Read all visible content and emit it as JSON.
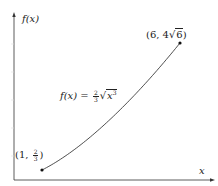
{
  "chart_data": {
    "type": "line",
    "title": "",
    "xlabel": "x",
    "ylabel": "f(x)",
    "function": "f(x) = (2/3) * sqrt(x^3)",
    "function_label": "f(x) = 2/3 √x³",
    "domain": [
      1,
      6
    ],
    "x": [
      1,
      1.5,
      2,
      2.5,
      3,
      3.5,
      4,
      4.5,
      5,
      5.5,
      6
    ],
    "series": [
      {
        "name": "f(x) = 2/3 √x³",
        "values": [
          0.667,
          1.225,
          1.886,
          2.635,
          3.464,
          4.365,
          5.333,
          6.364,
          7.454,
          8.6,
          9.798
        ]
      }
    ],
    "points": [
      {
        "label": "(1, 2/3)",
        "x": 1,
        "y": 0.667
      },
      {
        "label": "(6, 4√6)",
        "x": 6,
        "y": 9.798
      }
    ],
    "grid": false,
    "ticks_labeled": false,
    "legend": null,
    "colors": {
      "curve": "#222222",
      "axis": "#333333",
      "point": "#111111"
    }
  },
  "labels": {
    "y_axis": "f(x)",
    "x_axis": "x",
    "start_point": {
      "open": "(1, ",
      "num": "2",
      "den": "3",
      "close": ")"
    },
    "end_point": {
      "open": "(6, 4",
      "rad": "6",
      "close": ")"
    },
    "formula": {
      "lhs": "f(x) = ",
      "num": "2",
      "den": "3",
      "rad": "x",
      "exp": "3"
    }
  }
}
